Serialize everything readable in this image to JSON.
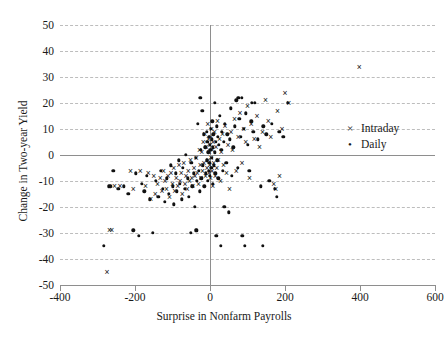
{
  "chart_data": {
    "type": "scatter",
    "title": "",
    "xlabel": "Surprise in Nonfarm Payrolls",
    "ylabel": "Change in Two-year Yield",
    "xlim": [
      -400,
      600
    ],
    "ylim": [
      -50,
      50
    ],
    "xticks": [
      -400,
      -200,
      0,
      200,
      400,
      600
    ],
    "yticks": [
      50,
      40,
      30,
      20,
      10,
      0,
      -10,
      -20,
      -30,
      -40,
      -50
    ],
    "grid": "horizontal-dashed",
    "legend_position": "right-middle",
    "reference_lines": {
      "x": 0,
      "y": 0
    },
    "series": [
      {
        "name": "Intraday",
        "marker": "x",
        "marker_glyph": "×",
        "color": "#111111",
        "points": [
          [
            -275,
            -45
          ],
          [
            -268,
            -29
          ],
          [
            -262,
            -29
          ],
          [
            -255,
            -12
          ],
          [
            -240,
            -12
          ],
          [
            -212,
            -6
          ],
          [
            -205,
            -13
          ],
          [
            -186,
            -6
          ],
          [
            -172,
            -12
          ],
          [
            -165,
            -7
          ],
          [
            -158,
            -17
          ],
          [
            -150,
            -8
          ],
          [
            -146,
            -15
          ],
          [
            -140,
            -11
          ],
          [
            -133,
            -9
          ],
          [
            -128,
            -14
          ],
          [
            -124,
            -6
          ],
          [
            -120,
            -10
          ],
          [
            -116,
            -13
          ],
          [
            -112,
            -8
          ],
          [
            -108,
            -16
          ],
          [
            -104,
            -7
          ],
          [
            -100,
            -11
          ],
          [
            -97,
            -5
          ],
          [
            -94,
            -14
          ],
          [
            -90,
            -9
          ],
          [
            -86,
            -12
          ],
          [
            -83,
            -4
          ],
          [
            -80,
            -10
          ],
          [
            -77,
            -7
          ],
          [
            -74,
            -15
          ],
          [
            -70,
            -3
          ],
          [
            -67,
            -11
          ],
          [
            -64,
            -8
          ],
          [
            -61,
            -13
          ],
          [
            -58,
            -6
          ],
          [
            -55,
            -10
          ],
          [
            -52,
            -2
          ],
          [
            -49,
            -9
          ],
          [
            -46,
            -12
          ],
          [
            -43,
            -5
          ],
          [
            -40,
            -8
          ],
          [
            -37,
            -1
          ],
          [
            -34,
            -7
          ],
          [
            -31,
            -11
          ],
          [
            -28,
            2
          ],
          [
            -26,
            -4
          ],
          [
            -24,
            -9
          ],
          [
            -22,
            1
          ],
          [
            -20,
            -6
          ],
          [
            -18,
            5
          ],
          [
            -16,
            -3
          ],
          [
            -14,
            8
          ],
          [
            -12,
            -8
          ],
          [
            -10,
            3
          ],
          [
            -8,
            -5
          ],
          [
            -6,
            12
          ],
          [
            -5,
            -2
          ],
          [
            -4,
            6
          ],
          [
            -3,
            -7
          ],
          [
            -2,
            1
          ],
          [
            -1,
            -4
          ],
          [
            0,
            4
          ],
          [
            1,
            -9
          ],
          [
            2,
            7
          ],
          [
            3,
            -1
          ],
          [
            4,
            10
          ],
          [
            5,
            -6
          ],
          [
            6,
            2
          ],
          [
            7,
            -12
          ],
          [
            8,
            5
          ],
          [
            10,
            -3
          ],
          [
            12,
            9
          ],
          [
            14,
            -8
          ],
          [
            16,
            3
          ],
          [
            18,
            -5
          ],
          [
            20,
            13
          ],
          [
            22,
            -2
          ],
          [
            25,
            6
          ],
          [
            28,
            -10
          ],
          [
            30,
            1
          ],
          [
            33,
            8
          ],
          [
            36,
            -4
          ],
          [
            40,
            11
          ],
          [
            44,
            -7
          ],
          [
            48,
            4
          ],
          [
            52,
            -13
          ],
          [
            56,
            9
          ],
          [
            60,
            2
          ],
          [
            65,
            14
          ],
          [
            70,
            -6
          ],
          [
            75,
            7
          ],
          [
            80,
            16
          ],
          [
            85,
            -3
          ],
          [
            90,
            10
          ],
          [
            95,
            5
          ],
          [
            100,
            19
          ],
          [
            105,
            -9
          ],
          [
            110,
            12
          ],
          [
            118,
            6
          ],
          [
            125,
            15
          ],
          [
            132,
            3
          ],
          [
            140,
            9
          ],
          [
            148,
            21
          ],
          [
            155,
            13
          ],
          [
            162,
            7
          ],
          [
            170,
            -11
          ],
          [
            175,
            -13
          ],
          [
            180,
            17
          ],
          [
            185,
            -8
          ],
          [
            192,
            10
          ],
          [
            200,
            24
          ],
          [
            210,
            20
          ],
          [
            398,
            34
          ]
        ]
      },
      {
        "name": "Daily",
        "marker": "dot",
        "marker_glyph": "•",
        "color": "#111111",
        "points": [
          [
            -283,
            -35
          ],
          [
            -270,
            -12
          ],
          [
            -266,
            -12
          ],
          [
            -258,
            -6
          ],
          [
            -245,
            -13
          ],
          [
            -230,
            -12
          ],
          [
            -218,
            -15
          ],
          [
            -205,
            -29
          ],
          [
            -198,
            -7
          ],
          [
            -190,
            -31
          ],
          [
            -182,
            -11
          ],
          [
            -175,
            -14
          ],
          [
            -168,
            -8
          ],
          [
            -160,
            -17
          ],
          [
            -152,
            -30
          ],
          [
            -145,
            -10
          ],
          [
            -138,
            -16
          ],
          [
            -132,
            -6
          ],
          [
            -126,
            -13
          ],
          [
            -120,
            -18
          ],
          [
            -115,
            -9
          ],
          [
            -110,
            -15
          ],
          [
            -105,
            -4
          ],
          [
            -100,
            -12
          ],
          [
            -96,
            -19
          ],
          [
            -92,
            -7
          ],
          [
            -88,
            -14
          ],
          [
            -84,
            -2
          ],
          [
            -80,
            -11
          ],
          [
            -76,
            -17
          ],
          [
            -72,
            -5
          ],
          [
            -68,
            -13
          ],
          [
            -64,
            0
          ],
          [
            -60,
            -9
          ],
          [
            -56,
            -16
          ],
          [
            -52,
            -30
          ],
          [
            -50,
            -3
          ],
          [
            -47,
            -12
          ],
          [
            -44,
            -7
          ],
          [
            -41,
            -20
          ],
          [
            -38,
            -1
          ],
          [
            -35,
            -10
          ],
          [
            -32,
            12
          ],
          [
            -30,
            -6
          ],
          [
            -28,
            -14
          ],
          [
            -26,
            22
          ],
          [
            -25,
            2
          ],
          [
            -23,
            -9
          ],
          [
            -21,
            17
          ],
          [
            -19,
            -4
          ],
          [
            -17,
            8
          ],
          [
            -15,
            -12
          ],
          [
            -13,
            3
          ],
          [
            -11,
            -7
          ],
          [
            -9,
            9
          ],
          [
            -8,
            -2
          ],
          [
            -7,
            5
          ],
          [
            -6,
            -10
          ],
          [
            -5,
            1
          ],
          [
            -4,
            -6
          ],
          [
            -3,
            7
          ],
          [
            -2,
            -3
          ],
          [
            -1,
            4
          ],
          [
            0,
            -8
          ],
          [
            1,
            2
          ],
          [
            2,
            10
          ],
          [
            3,
            -5
          ],
          [
            4,
            6
          ],
          [
            5,
            -1
          ],
          [
            6,
            13
          ],
          [
            7,
            -11
          ],
          [
            8,
            3
          ],
          [
            9,
            8
          ],
          [
            10,
            -4
          ],
          [
            12,
            1
          ],
          [
            13,
            20
          ],
          [
            14,
            -7
          ],
          [
            15,
            5
          ],
          [
            17,
            -31
          ],
          [
            18,
            11
          ],
          [
            19,
            -2
          ],
          [
            20,
            7
          ],
          [
            22,
            -9
          ],
          [
            24,
            4
          ],
          [
            26,
            15
          ],
          [
            28,
            -35
          ],
          [
            30,
            2
          ],
          [
            32,
            9
          ],
          [
            34,
            -6
          ],
          [
            36,
            5
          ],
          [
            38,
            -20
          ],
          [
            40,
            12
          ],
          [
            43,
            -3
          ],
          [
            46,
            8
          ],
          [
            50,
            -22
          ],
          [
            52,
            6
          ],
          [
            55,
            18
          ],
          [
            58,
            -8
          ],
          [
            62,
            3
          ],
          [
            66,
            11
          ],
          [
            70,
            21
          ],
          [
            74,
            -5
          ],
          [
            78,
            14
          ],
          [
            82,
            7
          ],
          [
            86,
            -31
          ],
          [
            90,
            10
          ],
          [
            95,
            16
          ],
          [
            100,
            4
          ],
          [
            105,
            -6
          ],
          [
            110,
            13
          ],
          [
            115,
            9
          ],
          [
            120,
            20
          ],
          [
            128,
            6
          ],
          [
            135,
            -12
          ],
          [
            142,
            11
          ],
          [
            150,
            8
          ],
          [
            158,
            -10
          ],
          [
            165,
            12
          ],
          [
            172,
            -13
          ],
          [
            178,
            -16
          ],
          [
            185,
            9
          ],
          [
            195,
            7
          ],
          [
            208,
            20
          ],
          [
            93,
            -35
          ],
          [
            140,
            -35
          ],
          [
            -35,
            -29
          ],
          [
            -38,
            -29
          ],
          [
            75,
            22
          ],
          [
            84,
            22
          ],
          [
            112,
            20
          ]
        ]
      }
    ]
  },
  "legend": {
    "items": [
      {
        "label": "Intraday",
        "marker": "×"
      },
      {
        "label": "Daily",
        "marker": "•"
      }
    ]
  }
}
